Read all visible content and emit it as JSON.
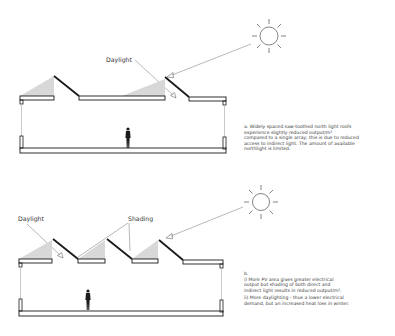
{
  "diagram_a": {
    "label_daylight": "Daylight",
    "caption_lines": [
      "a. Widely spaced saw-toothed north light roofs",
      "experience slightly reduced output/m²",
      "compared to a single array; this is due to reduced",
      "access to indirect light. The amount of available",
      "northlight is limited."
    ]
  },
  "diagram_b": {
    "label_daylight": "Daylight",
    "label_shading": "Shading",
    "caption_heading": "b.",
    "caption_i_lines": [
      "i) More PV area gives greater electrical",
      "output but shading of both direct and",
      "indirect light results in reduced output/m²."
    ],
    "caption_ii_lines": [
      "ii) More daylighting - thus a lower electrical",
      "demand, but an increased heat loss in winter."
    ]
  },
  "colors": {
    "line": "#1a1a1a",
    "shade": "#c8c8c8",
    "ray": "#9a9a9a"
  }
}
